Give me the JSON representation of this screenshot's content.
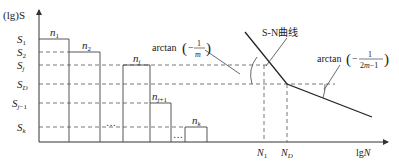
{
  "diagram": {
    "type": "S-N curve with loading spectrum",
    "axes": {
      "y_label": "(lg)S",
      "x_label": "lgN"
    },
    "stress_levels": [
      {
        "key": "S1",
        "main": "S",
        "sub": "1",
        "y": 39
      },
      {
        "key": "S2",
        "main": "S",
        "sub": "2",
        "y": 52
      },
      {
        "key": "Sj",
        "main": "S",
        "sub": "j",
        "y": 65
      },
      {
        "key": "SD",
        "main": "S",
        "sub": "D",
        "y": 84
      },
      {
        "key": "Sj-1",
        "main": "S",
        "sub": "j−1",
        "y": 103
      },
      {
        "key": "Sk",
        "main": "S",
        "sub": "k",
        "y": 127
      }
    ],
    "blocks": [
      {
        "main": "n",
        "sub": "1"
      },
      {
        "main": "n",
        "sub": "2"
      },
      {
        "main": "n",
        "sub": "j"
      },
      {
        "main": "n",
        "sub": "j+1"
      },
      {
        "main": "n",
        "sub": "k"
      }
    ],
    "ellipsis": "…",
    "x_markers": [
      {
        "main": "N",
        "sub": "1"
      },
      {
        "main": "N",
        "sub": "D"
      }
    ],
    "curve_label": "S-N曲线",
    "slope_label_1": {
      "prefix": "arctan",
      "numerator": "1",
      "denominator": "m"
    },
    "slope_label_2": {
      "prefix": "arctan",
      "numerator": "1",
      "denominator": "2m−1"
    }
  }
}
